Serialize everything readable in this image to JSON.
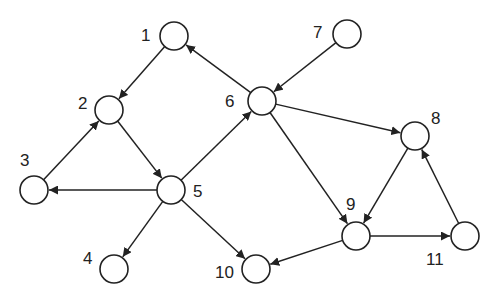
{
  "diagram": {
    "type": "directed-graph",
    "colors": {
      "stroke": "#222222",
      "node_fill": "#ffffff",
      "background": "#ffffff"
    },
    "nodes": [
      {
        "id": "1",
        "label": "1"
      },
      {
        "id": "2",
        "label": "2"
      },
      {
        "id": "3",
        "label": "3"
      },
      {
        "id": "4",
        "label": "4"
      },
      {
        "id": "5",
        "label": "5"
      },
      {
        "id": "6",
        "label": "6"
      },
      {
        "id": "7",
        "label": "7"
      },
      {
        "id": "8",
        "label": "8"
      },
      {
        "id": "9",
        "label": "9"
      },
      {
        "id": "10",
        "label": "10"
      },
      {
        "id": "11",
        "label": "11"
      }
    ],
    "edges": [
      {
        "from": "1",
        "to": "2"
      },
      {
        "from": "3",
        "to": "2"
      },
      {
        "from": "2",
        "to": "5"
      },
      {
        "from": "5",
        "to": "3"
      },
      {
        "from": "5",
        "to": "4"
      },
      {
        "from": "5",
        "to": "6"
      },
      {
        "from": "5",
        "to": "10"
      },
      {
        "from": "6",
        "to": "1"
      },
      {
        "from": "7",
        "to": "6"
      },
      {
        "from": "6",
        "to": "8"
      },
      {
        "from": "6",
        "to": "9"
      },
      {
        "from": "8",
        "to": "9"
      },
      {
        "from": "9",
        "to": "11"
      },
      {
        "from": "11",
        "to": "8"
      },
      {
        "from": "9",
        "to": "10"
      }
    ]
  }
}
